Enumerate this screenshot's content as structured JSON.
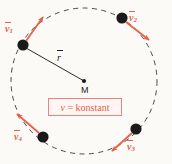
{
  "figure": {
    "background_color": "#fbfaf7",
    "circle": {
      "center_x": 84,
      "center_y": 81,
      "radius": 73,
      "stroke_color": "#4a4a4a",
      "style": "dashed"
    },
    "center_point": {
      "name": "M",
      "label": "M",
      "x": 84,
      "y": 81,
      "color": "#1a1a1a"
    },
    "radius_vector": {
      "label": "r",
      "overbar": true,
      "from_x": 84,
      "from_y": 81,
      "to_x": 25,
      "to_y": 47,
      "color": "#1a1a1a"
    },
    "velocity_color": "#e8604c",
    "particle_color": "#1a1a1a",
    "particles": [
      {
        "id": "v1",
        "label": "v",
        "subscript": "1",
        "x": 23,
        "y": 45,
        "arrow_to_x": 43,
        "arrow_to_y": 16,
        "label_x": 6,
        "label_y": 24
      },
      {
        "id": "v2",
        "label": "v",
        "subscript": "2",
        "x": 122,
        "y": 18,
        "arrow_to_x": 150,
        "arrow_to_y": 40,
        "label_x": 130,
        "label_y": 14
      },
      {
        "id": "v3",
        "label": "v",
        "subscript": "3",
        "x": 136,
        "y": 129,
        "arrow_to_x": 111,
        "arrow_to_y": 152,
        "label_x": 127,
        "label_y": 143
      },
      {
        "id": "v4",
        "label": "v",
        "subscript": "4",
        "x": 43,
        "y": 137,
        "arrow_to_x": 16,
        "arrow_to_y": 113,
        "label_x": 15,
        "label_y": 133
      }
    ],
    "constant_box": {
      "symbol": "v",
      "equals": " = ",
      "value": "konstant",
      "border_color": "#e8847a",
      "text_color": "#e8604c"
    }
  }
}
